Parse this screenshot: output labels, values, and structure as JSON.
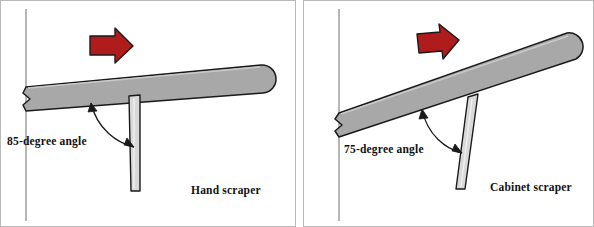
{
  "figure": {
    "background_color": "#ffffff",
    "border_color": "#b9b9b9"
  },
  "colors": {
    "blade_fill": "#a8a8a8",
    "blade_stroke": "#1a1a1a",
    "tool_fill": "#d9d9d9",
    "tool_stroke": "#1a1a1a",
    "arrow_red_fill": "#b01c1c",
    "arrow_red_stroke": "#1a1a1a",
    "reference_line": "#7a7a7a",
    "annotation_stroke": "#1a1a1a",
    "text": "#121212"
  },
  "panels": [
    {
      "id": "hand-scraper",
      "caption": "Hand scraper",
      "angle_label": "85-degree angle",
      "angle_degrees": 85,
      "blade_tilt_degrees": 8,
      "tool_orientation": "vertical",
      "direction_arrow": {
        "name": "motion-arrow",
        "direction": "right",
        "color": "#b01c1c"
      },
      "annotation_arrow": {
        "name": "angle-arc",
        "style": "double-headed-curve"
      }
    },
    {
      "id": "cabinet-scraper",
      "caption": "Cabinet scraper",
      "angle_label": "75-degree angle",
      "angle_degrees": 75,
      "blade_tilt_degrees": 16,
      "tool_orientation": "tilted",
      "direction_arrow": {
        "name": "motion-arrow",
        "direction": "right",
        "color": "#b01c1c"
      },
      "annotation_arrow": {
        "name": "angle-arc",
        "style": "double-headed-curve"
      }
    }
  ]
}
